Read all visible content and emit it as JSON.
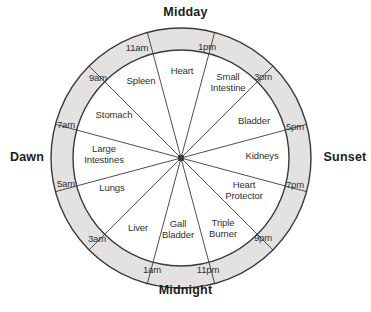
{
  "diagram": {
    "colors": {
      "ring_fill": "#e4e2e1",
      "inner_fill": "#ffffff",
      "stroke": "#3a3a3a",
      "text": "#303030",
      "cardinal_text": "#1d1d1d"
    },
    "geometry": {
      "center_x": 181,
      "center_y": 158,
      "outer_radius": 130,
      "inner_radius": 108,
      "segments": 12,
      "segment_degrees": 30
    },
    "cardinals": [
      {
        "name": "midday",
        "label": "Midday"
      },
      {
        "name": "midnight",
        "label": "Midnight"
      },
      {
        "name": "dawn",
        "label": "Dawn"
      },
      {
        "name": "sunset",
        "label": "Sunset"
      }
    ],
    "hours": [
      {
        "label": "11am",
        "angle_deg": -15,
        "x": 137,
        "y": 47
      },
      {
        "label": "1pm",
        "angle_deg": 15,
        "x": 207,
        "y": 46
      },
      {
        "label": "3pm",
        "angle_deg": 45,
        "x": 263,
        "y": 76
      },
      {
        "label": "5pm",
        "angle_deg": 75,
        "x": 295,
        "y": 126
      },
      {
        "label": "7pm",
        "angle_deg": 105,
        "x": 295,
        "y": 184
      },
      {
        "label": "9pm",
        "angle_deg": 135,
        "x": 263,
        "y": 237
      },
      {
        "label": "11pm",
        "angle_deg": 165,
        "x": 208,
        "y": 269
      },
      {
        "label": "1am",
        "angle_deg": 195,
        "x": 152,
        "y": 269
      },
      {
        "label": "3am",
        "angle_deg": 225,
        "x": 97,
        "y": 238
      },
      {
        "label": "5am",
        "angle_deg": 255,
        "x": 66,
        "y": 183
      },
      {
        "label": "7am",
        "angle_deg": 285,
        "x": 66,
        "y": 124
      },
      {
        "label": "9am",
        "angle_deg": 315,
        "x": 98,
        "y": 77
      }
    ],
    "segments": [
      {
        "name": "heart",
        "label": "Heart",
        "hours": "11am-1pm",
        "x": 182,
        "y": 71
      },
      {
        "name": "small-intestine",
        "label": "Small\nIntestine",
        "hours": "1pm-3pm",
        "x": 228,
        "y": 82
      },
      {
        "name": "bladder",
        "label": "Bladder",
        "hours": "3pm-5pm",
        "x": 254,
        "y": 121
      },
      {
        "name": "kidneys",
        "label": "Kidneys",
        "hours": "5pm-7pm",
        "x": 262,
        "y": 156
      },
      {
        "name": "heart-protector",
        "label": "Heart\nProtector",
        "hours": "7pm-9pm",
        "x": 244,
        "y": 190
      },
      {
        "name": "triple-burner",
        "label": "Triple\nBurner",
        "hours": "9pm-11pm",
        "x": 223,
        "y": 228
      },
      {
        "name": "gall-bladder",
        "label": "Gall\nBladder",
        "hours": "11pm-1am",
        "x": 178,
        "y": 229
      },
      {
        "name": "liver",
        "label": "Liver",
        "hours": "1am-3am",
        "x": 138,
        "y": 228
      },
      {
        "name": "lungs",
        "label": "Lungs",
        "hours": "3am-5am",
        "x": 112,
        "y": 188
      },
      {
        "name": "large-intestines",
        "label": "Large\nIntestines",
        "hours": "5am-7am",
        "x": 104,
        "y": 154
      },
      {
        "name": "stomach",
        "label": "Stomach",
        "hours": "7am-9am",
        "x": 114,
        "y": 115
      },
      {
        "name": "spleen",
        "label": "Spleen",
        "hours": "9am-11am",
        "x": 141,
        "y": 81
      }
    ]
  }
}
